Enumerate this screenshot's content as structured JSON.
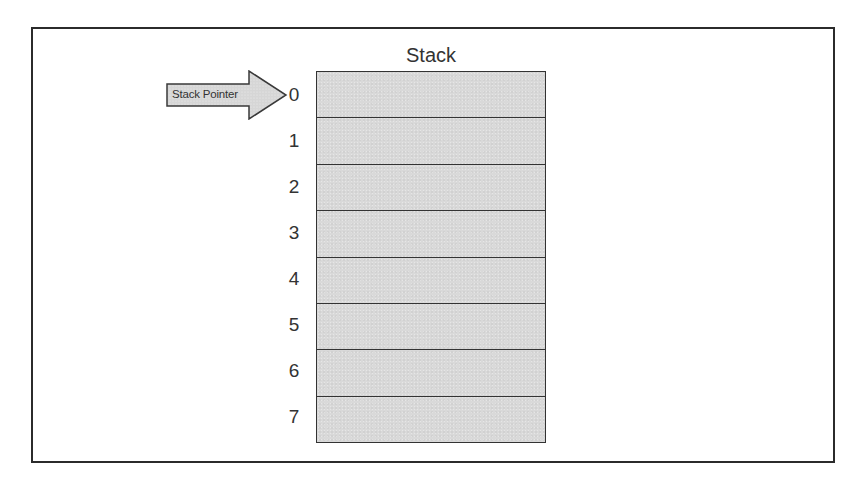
{
  "diagram": {
    "title": "Stack",
    "pointer": {
      "label": "Stack Pointer",
      "points_to_index": 0
    },
    "slots": [
      {
        "index": "0"
      },
      {
        "index": "1"
      },
      {
        "index": "2"
      },
      {
        "index": "3"
      },
      {
        "index": "4"
      },
      {
        "index": "5"
      },
      {
        "index": "6"
      },
      {
        "index": "7"
      }
    ],
    "colors": {
      "slot_fill": "#d9d9d9",
      "border": "#333333",
      "frame": "#2b2b2b",
      "background": "#ffffff"
    }
  }
}
